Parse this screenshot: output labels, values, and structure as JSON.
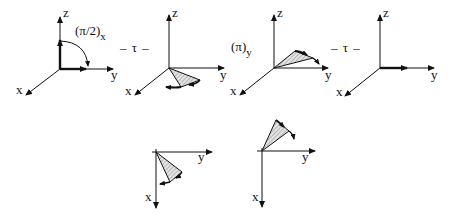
{
  "diagram": {
    "title": "",
    "style": {
      "line_color": "#111111",
      "hatch_color": "#888888",
      "background": "#ffffff"
    },
    "operators": [
      {
        "id": "rot_x",
        "text": "(π/2)",
        "subscript": "x"
      },
      {
        "id": "tau1",
        "text": "– τ –"
      },
      {
        "id": "rot_y",
        "text": "(π)",
        "subscript": "y"
      },
      {
        "id": "tau2",
        "text": "– τ –"
      }
    ],
    "panels": [
      {
        "id": "panel-1",
        "axes": {
          "z": "z",
          "y": "y",
          "x": "x"
        },
        "content": "thick vectors along z and y with 90° arc from z to y"
      },
      {
        "id": "panel-2",
        "axes": {
          "z": "z",
          "y": "y",
          "x": "x"
        },
        "content": "hatched cone fanning below xy-plane with curved arrowheads"
      },
      {
        "id": "panel-3",
        "axes": {
          "z": "z",
          "y": "y",
          "x": "x"
        },
        "content": "hatched cone fanning above y axis with curved arrowheads"
      },
      {
        "id": "panel-4",
        "axes": {
          "z": "z",
          "y": "y",
          "x": "x"
        },
        "content": "thick vector along y (refocused)"
      },
      {
        "id": "panel-5",
        "axes": {
          "y": "y",
          "x": "x"
        },
        "content": "top view: hatched cone between x and y below y axis"
      },
      {
        "id": "panel-6",
        "axes": {
          "y": "y",
          "x": "x"
        },
        "content": "top view: hatched cone opposite side above y axis"
      }
    ]
  }
}
